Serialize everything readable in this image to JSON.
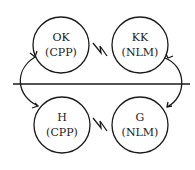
{
  "diagram": {
    "nodes": [
      {
        "id": "ok",
        "name": "OK",
        "group": "(CPP)",
        "cx": 61,
        "cy": 45,
        "r": 28
      },
      {
        "id": "kk",
        "name": "KK",
        "group": "(NLM)",
        "cx": 140,
        "cy": 45,
        "r": 28
      },
      {
        "id": "h",
        "name": "H",
        "group": "(CPP)",
        "cx": 62,
        "cy": 125,
        "r": 28
      },
      {
        "id": "g",
        "name": "G",
        "group": "(NLM)",
        "cx": 140,
        "cy": 125,
        "r": 28
      }
    ],
    "conflict_links": [
      {
        "from": "ok",
        "to": "kk",
        "symbol": "lightning-bolt"
      },
      {
        "from": "h",
        "to": "g",
        "symbol": "lightning-bolt"
      }
    ],
    "divider": {
      "y": 84,
      "x1": 13,
      "x2": 190
    },
    "arrows": [
      {
        "from": "h",
        "to": "ok",
        "side": "left"
      },
      {
        "from": "kk",
        "to": "g",
        "side": "right"
      }
    ]
  }
}
